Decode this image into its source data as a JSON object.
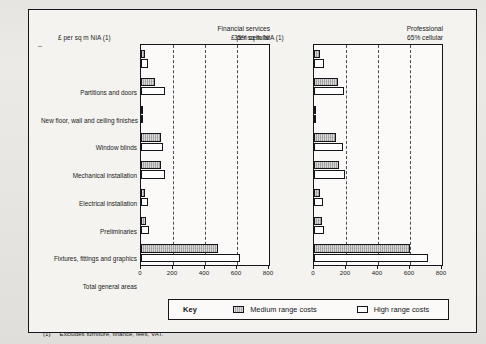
{
  "figure": {
    "unit_label": "£ per sq m NIA (1)",
    "footnote_mark": "(1)",
    "footnote_text": "Excludes furniture, finance, fees, VAT."
  },
  "legend": {
    "title": "Key",
    "items": [
      {
        "label": "Medium range costs",
        "series": "medium",
        "color": "#a9a9a9"
      },
      {
        "label": "High range costs",
        "series": "high",
        "color": "#ffffff"
      }
    ]
  },
  "chart_data": [
    {
      "type": "bar",
      "orientation": "horizontal",
      "title": "Financial services",
      "subtitle": "35% cellular",
      "xlabel": "£ per sq m NIA (1)",
      "ylabel": "",
      "xlim": [
        0,
        800
      ],
      "xticks": [
        0,
        200,
        400,
        600,
        800
      ],
      "xticklabels": [
        "0",
        "200",
        "400",
        "600",
        "800"
      ],
      "grid": "vertical-dashed-at-200-400-600",
      "legend_position": "below-figure",
      "categories": [
        "Partitions and doors",
        "New floor, wall and ceiling finishes",
        "New floor, wall and ceiling finishes",
        "Window blinds",
        "Mechanical installation",
        "Electrical installation",
        "Preliminaries",
        "Fixtures, fittings and graphics",
        "Total general areas"
      ],
      "series": [
        {
          "name": "Medium range costs",
          "values": [
            28,
            88,
            8,
            128,
            124,
            28,
            30,
            480
          ]
        },
        {
          "name": "High range costs",
          "values": [
            42,
            150,
            8,
            140,
            150,
            42,
            48,
            620
          ]
        }
      ]
    },
    {
      "type": "bar",
      "orientation": "horizontal",
      "title": "Professional",
      "subtitle": "65% cellular",
      "xlabel": "£ per sq m NIA (1)",
      "ylabel": "",
      "xlim": [
        0,
        800
      ],
      "xticks": [
        0,
        200,
        400,
        600,
        800
      ],
      "xticklabels": [
        "0",
        "200",
        "400",
        "600",
        "800"
      ],
      "grid": "vertical-dashed-at-200-400-600",
      "legend_position": "below-figure",
      "categories": [
        "Partitions and doors",
        "New floor, wall and ceiling finishes",
        "Window blinds",
        "Mechanical installation",
        "Electrical installation",
        "Preliminaries",
        "Fixtures, fittings and graphics",
        "Total general areas"
      ],
      "series": [
        {
          "name": "Medium range costs",
          "values": [
            40,
            150,
            6,
            140,
            155,
            40,
            48,
            600
          ]
        },
        {
          "name": "High range costs",
          "values": [
            62,
            190,
            6,
            180,
            195,
            58,
            62,
            710
          ]
        }
      ]
    }
  ],
  "categories": [
    "Partitions and doors",
    "New floor, wall and ceiling finishes",
    "Window blinds",
    "Mechanical installation",
    "Electrical installation",
    "Preliminaries",
    "Fixtures, fittings and graphics",
    "Total general areas"
  ]
}
